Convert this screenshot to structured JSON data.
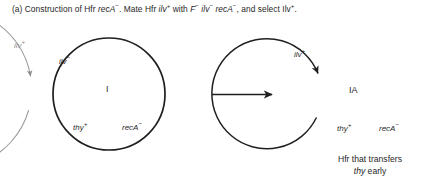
{
  "figure": {
    "id": "panel-a",
    "width": 448,
    "height": 189,
    "background": "#ffffff",
    "ink_black": "#1f1f1f",
    "ink_gray": "#8d8d8d"
  },
  "top_caption": {
    "panel_letter": "(a)",
    "t1": " Construction of Hfr ",
    "g1": "recA",
    "g1sup": "−",
    "t2": ". Mate Hfr ",
    "g2": "ilv",
    "g2sup": "+",
    "t3": " with ",
    "g3": "F",
    "g3sup": "−",
    "g4": "ilv",
    "g4sup": "−",
    "g5": "recA",
    "g5sup": "−",
    "t4": ", and select Ilv",
    "t4sup": "+",
    "t5": ".",
    "full_text": "(a) Construction of Hfr recA−. Mate Hfr ilv+ with F− ilv− recA−, and select Ilv+."
  },
  "left_diagram": {
    "name": "hfr-donor-chromosome",
    "outer_ring": {
      "label": "ilv",
      "sup": "+",
      "color": "#8d8d8d",
      "direction": "counterclockwise"
    },
    "inner_ring": {
      "color": "#1f1f1f",
      "center_label": "I",
      "markers": [
        {
          "label": "ilv",
          "sup": "−",
          "position": "upper-left"
        },
        {
          "label": "thy",
          "sup": "+",
          "position": "bottom-left"
        },
        {
          "label": "recA",
          "sup": "−",
          "position": "bottom-right"
        }
      ]
    }
  },
  "transition_arrow": {
    "name": "process-arrow",
    "direction": "right",
    "color": "#1f1f1f"
  },
  "right_diagram": {
    "name": "recombinant-hfr-chromosome",
    "ring": {
      "color": "#1f1f1f",
      "center_label": "IA",
      "direction": "counterclockwise",
      "markers": [
        {
          "label": "ilv",
          "sup": "+",
          "position": "outside-upper-left"
        },
        {
          "label": "thy",
          "sup": "+",
          "position": "bottom-left"
        },
        {
          "label": "recA",
          "sup": "−",
          "position": "bottom-right"
        }
      ]
    }
  },
  "bottom_caption": {
    "line1": "Hfr that transfers",
    "line2_italic": "thy",
    "line2_rest": " early",
    "full_text": "Hfr that transfers thy early"
  }
}
